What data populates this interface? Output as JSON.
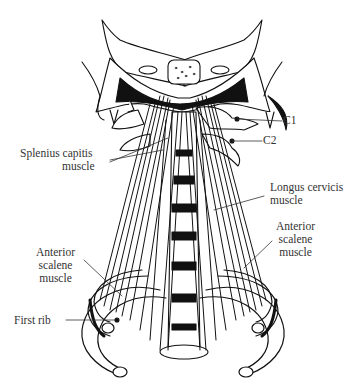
{
  "figure": {
    "labels": {
      "c1": "C1",
      "c2": "C2",
      "splenius": [
        "Splenius capitis",
        "muscle"
      ],
      "longus": [
        "Longus cervicis",
        "muscle"
      ],
      "anterior_scalene_right": [
        "Anterior",
        "scalene",
        "muscle"
      ],
      "anterior_scalene_left": [
        "Anterior",
        "scalene",
        "muscle"
      ],
      "first_rib": "First rib"
    },
    "colors": {
      "ink": "#111111",
      "label_text": "#333333",
      "background": "#ffffff"
    }
  }
}
